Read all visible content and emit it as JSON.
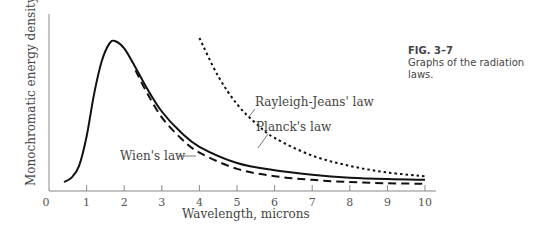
{
  "caption": {
    "figure_number": "FIG. 3–7",
    "text": "Graphs of the radiation laws."
  },
  "chart_data": {
    "type": "line",
    "title": "Graphs of the radiation laws",
    "xlabel": "Wavelength, microns",
    "ylabel": "Monochromatic energy density, Ψλ",
    "xlim": [
      0,
      10.3
    ],
    "x_ticks": [
      "0",
      "1",
      "2",
      "3",
      "4",
      "5",
      "6",
      "7",
      "8",
      "9",
      "10"
    ],
    "y_ticks": [],
    "grid": false,
    "legend": "inline labels",
    "series": [
      {
        "name": "Planck's law",
        "style": "solid",
        "x": [
          0.4,
          0.6,
          0.8,
          1.0,
          1.2,
          1.4,
          1.6,
          1.75,
          2.0,
          2.3,
          2.6,
          3.0,
          3.5,
          4.0,
          5.0,
          6.0,
          7.0,
          8.0,
          9.0,
          10.0
        ],
        "y": [
          0.02,
          0.05,
          0.13,
          0.33,
          0.62,
          0.84,
          0.96,
          0.98,
          0.93,
          0.8,
          0.66,
          0.5,
          0.36,
          0.26,
          0.15,
          0.1,
          0.07,
          0.05,
          0.04,
          0.035
        ]
      },
      {
        "name": "Wien's law",
        "style": "dashed",
        "x": [
          2.3,
          2.6,
          3.0,
          3.5,
          4.0,
          5.0,
          6.0,
          7.0,
          8.0,
          9.0,
          10.0
        ],
        "y": [
          0.78,
          0.63,
          0.46,
          0.32,
          0.22,
          0.11,
          0.06,
          0.035,
          0.02,
          0.012,
          0.008
        ]
      },
      {
        "name": "Rayleigh-Jeans' law",
        "style": "dotted",
        "x": [
          4.0,
          4.5,
          5.0,
          5.5,
          6.0,
          7.0,
          8.0,
          9.0,
          10.0
        ],
        "y": [
          1.0,
          0.74,
          0.55,
          0.42,
          0.32,
          0.2,
          0.13,
          0.085,
          0.06
        ]
      }
    ],
    "annotations": [
      {
        "text": "Planck's law",
        "x": 4.0,
        "y": 0.35
      },
      {
        "text": "Wien's law",
        "x": 3.2,
        "y": 0.22
      },
      {
        "text": "Rayleigh-Jeans' law",
        "x": 5.2,
        "y": 0.5
      }
    ]
  }
}
